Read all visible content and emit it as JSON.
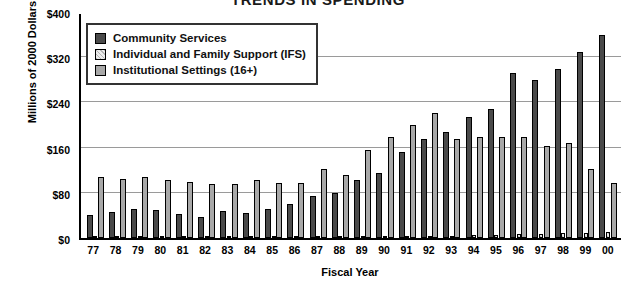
{
  "chart_data": {
    "type": "bar",
    "title": "TRENDS IN SPENDING",
    "xlabel": "Fiscal Year",
    "ylabel": "Millions of 2000 Dollars",
    "ylim": [
      0,
      400
    ],
    "yticks": [
      "$0",
      "$80",
      "$160",
      "$240",
      "$320",
      "$400"
    ],
    "ytick_values": [
      0,
      80,
      160,
      240,
      320,
      400
    ],
    "grid": true,
    "legend_position": "top-left",
    "categories": [
      "77",
      "78",
      "79",
      "80",
      "81",
      "82",
      "83",
      "84",
      "85",
      "86",
      "87",
      "88",
      "89",
      "90",
      "91",
      "92",
      "93",
      "94",
      "95",
      "96",
      "97",
      "98",
      "99",
      "00"
    ],
    "series": [
      {
        "name": "Community Services",
        "color": "#4a4a4a",
        "values": [
          40,
          46,
          52,
          50,
          42,
          38,
          48,
          44,
          52,
          60,
          74,
          80,
          102,
          115,
          152,
          175,
          188,
          215,
          228,
          292,
          280,
          300,
          330,
          360
        ]
      },
      {
        "name": "Individual and Family Support (IFS)",
        "color": "#dcdcdc",
        "values": [
          1,
          1,
          1,
          1,
          1,
          1,
          1,
          1,
          1,
          2,
          2,
          2,
          2,
          3,
          3,
          4,
          4,
          5,
          6,
          7,
          7,
          8,
          9,
          10
        ]
      },
      {
        "name": "Institutional Settings (16+)",
        "color": "#a8a8a8",
        "values": [
          108,
          104,
          108,
          102,
          100,
          96,
          96,
          102,
          98,
          98,
          122,
          112,
          155,
          178,
          200,
          222,
          175,
          178,
          178,
          178,
          162,
          168,
          122,
          98
        ]
      }
    ]
  },
  "legend": {
    "items": [
      {
        "label": "Community Services",
        "swatch": "cs"
      },
      {
        "label": "Individual and Family Support (IFS)",
        "swatch": "ifs"
      },
      {
        "label": "Institutional Settings (16+)",
        "swatch": "inst"
      }
    ]
  }
}
